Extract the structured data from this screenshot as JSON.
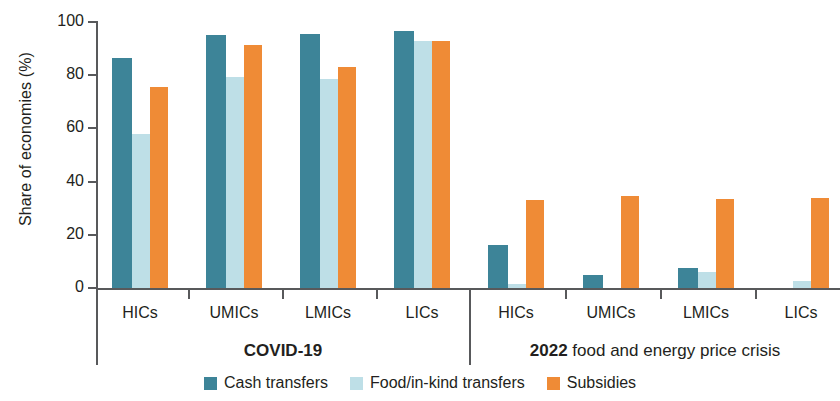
{
  "chart_data": {
    "type": "bar",
    "title": "",
    "xlabel": "",
    "ylabel": "Share of economies (%)",
    "ylim": [
      0,
      100
    ],
    "yticks": [
      0,
      20,
      40,
      60,
      80,
      100
    ],
    "ytick_labels": [
      "0",
      "20",
      "40",
      "60",
      "80",
      "100"
    ],
    "grid": false,
    "legend_position": "bottom",
    "panels": [
      {
        "label": "COVID-19",
        "label_lead": "",
        "categories": [
          "HICs",
          "UMICs",
          "LMICs",
          "LICs"
        ],
        "series": [
          {
            "name": "Cash transfers",
            "color": "#3d8498",
            "values": [
              86.5,
              95.0,
              95.5,
              96.5
            ]
          },
          {
            "name": "Food/in-kind transfers",
            "color": "#bedfe7",
            "values": [
              58.0,
              79.5,
              78.5,
              93.0
            ]
          },
          {
            "name": "Subsidies",
            "color": "#ef8b36",
            "values": [
              75.5,
              91.5,
              83.0,
              93.0
            ]
          }
        ]
      },
      {
        "label": "2022 food and energy price crisis",
        "label_lead": "2022",
        "label_rest": " food and energy price crisis",
        "categories": [
          "HICs",
          "UMICs",
          "LMICs",
          "LICs"
        ],
        "series": [
          {
            "name": "Cash transfers",
            "color": "#3d8498",
            "values": [
              16.2,
              5.0,
              7.5,
              0.0
            ]
          },
          {
            "name": "Food/in-kind transfers",
            "color": "#bedfe7",
            "values": [
              1.5,
              0.0,
              6.0,
              2.5
            ]
          },
          {
            "name": "Subsidies",
            "color": "#ef8b36",
            "values": [
              33.0,
              34.5,
              33.5,
              34.0
            ]
          }
        ]
      }
    ],
    "legend": [
      {
        "label": "Cash transfers",
        "color": "#3d8498"
      },
      {
        "label": "Food/in-kind transfers",
        "color": "#bedfe7"
      },
      {
        "label": "Subsidies",
        "color": "#ef8b36"
      }
    ],
    "colors": {
      "cash_transfers": "#3d8498",
      "food_in_kind_transfers": "#bedfe7",
      "subsidies": "#ef8b36",
      "axis": "#58595b",
      "text": "#231f20"
    }
  }
}
